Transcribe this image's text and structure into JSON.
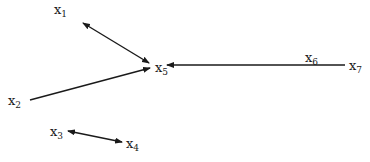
{
  "diagram": {
    "type": "directed-graph",
    "nodes": [
      {
        "id": "x1",
        "base": "x",
        "sub": "1",
        "x": 54,
        "y": 3
      },
      {
        "id": "x2",
        "base": "x",
        "sub": "2",
        "x": 8,
        "y": 94
      },
      {
        "id": "x3",
        "base": "x",
        "sub": "3",
        "x": 50,
        "y": 125
      },
      {
        "id": "x4",
        "base": "x",
        "sub": "4",
        "x": 126,
        "y": 137
      },
      {
        "id": "x5",
        "base": "x",
        "sub": "5",
        "x": 155,
        "y": 61
      },
      {
        "id": "x7",
        "base": "x",
        "sub": "7",
        "x": 349,
        "y": 59
      }
    ],
    "edge_labels": [
      {
        "id": "x6",
        "base": "x",
        "sub": "6",
        "x": 305,
        "y": 51
      }
    ],
    "edges": [
      {
        "from": "x1",
        "to": "x5",
        "direction": "both",
        "x1": 83,
        "y1": 23,
        "x2": 149,
        "y2": 63
      },
      {
        "from": "x2",
        "to": "x5",
        "direction": "forward",
        "x1": 30,
        "y1": 100,
        "x2": 150,
        "y2": 68
      },
      {
        "from": "x7",
        "to": "x5",
        "direction": "forward",
        "label": "x6",
        "x1": 345,
        "y1": 65,
        "x2": 167,
        "y2": 65
      },
      {
        "from": "x3",
        "to": "x4",
        "direction": "both",
        "x1": 68,
        "y1": 131,
        "x2": 122,
        "y2": 142
      }
    ],
    "color": "#1a1a1a"
  }
}
